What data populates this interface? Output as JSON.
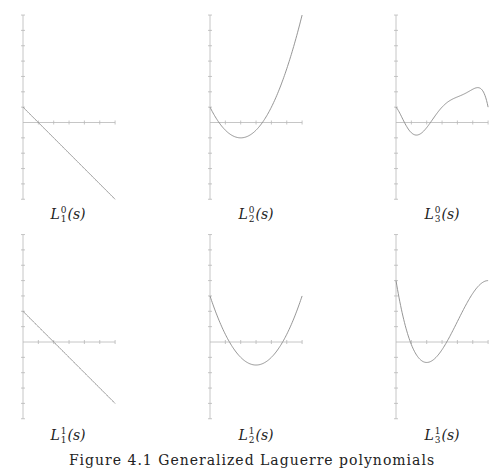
{
  "figure": {
    "caption": "Figure 4.1  Generalized Laguerre polynomials"
  },
  "panels": [
    {
      "name": "L",
      "sub": "1",
      "sup": "0",
      "arg": "(s)"
    },
    {
      "name": "L",
      "sub": "2",
      "sup": "0",
      "arg": "(s)"
    },
    {
      "name": "L",
      "sub": "3",
      "sup": "0",
      "arg": "(s)"
    },
    {
      "name": "L",
      "sub": "1",
      "sup": "1",
      "arg": "(s)"
    },
    {
      "name": "L",
      "sub": "2",
      "sup": "1",
      "arg": "(s)"
    },
    {
      "name": "L",
      "sub": "3",
      "sup": "1",
      "arg": "(s)"
    }
  ],
  "chart_data": [
    {
      "type": "line",
      "title": "L_1^0(s)",
      "xlim": [
        0,
        6
      ],
      "ylim": [
        -5,
        7
      ],
      "x": [
        0,
        1,
        2,
        3,
        4,
        5,
        6
      ],
      "y": [
        1,
        0,
        -1,
        -2,
        -3,
        -4,
        -5
      ],
      "grid": false
    },
    {
      "type": "line",
      "title": "L_2^0(s)",
      "xlim": [
        0,
        6
      ],
      "ylim": [
        -5,
        7
      ],
      "x": [
        0,
        1,
        2,
        3,
        4,
        5,
        6
      ],
      "y": [
        1,
        -0.5,
        -1,
        -0.5,
        1,
        3.5,
        7
      ],
      "grid": false
    },
    {
      "type": "line",
      "title": "L_3^0(s)",
      "xlim": [
        0,
        6
      ],
      "ylim": [
        -5,
        7
      ],
      "x": [
        0,
        1,
        2,
        3,
        4,
        5,
        6
      ],
      "y": [
        1,
        -0.667,
        -0.333,
        1,
        1.667,
        2.167,
        1
      ],
      "grid": false
    },
    {
      "type": "line",
      "title": "L_1^1(s)",
      "xlim": [
        0,
        6
      ],
      "ylim": [
        -5,
        7
      ],
      "x": [
        0,
        1,
        2,
        3,
        4,
        5,
        6
      ],
      "y": [
        2,
        1,
        0,
        -1,
        -2,
        -3,
        -4
      ],
      "grid": false
    },
    {
      "type": "line",
      "title": "L_2^1(s)",
      "xlim": [
        0,
        6
      ],
      "ylim": [
        -5,
        7
      ],
      "x": [
        0,
        1,
        2,
        3,
        4,
        5,
        6
      ],
      "y": [
        3,
        0.5,
        -1,
        -1.5,
        -1,
        0.5,
        3
      ],
      "grid": false
    },
    {
      "type": "line",
      "title": "L_3^1(s)",
      "xlim": [
        0,
        6
      ],
      "ylim": [
        -5,
        7
      ],
      "x": [
        0,
        1,
        2,
        3,
        4,
        5,
        6
      ],
      "y": [
        4,
        -0.167,
        -1.333,
        -0.5,
        1.333,
        3.167,
        4
      ],
      "grid": false
    }
  ]
}
